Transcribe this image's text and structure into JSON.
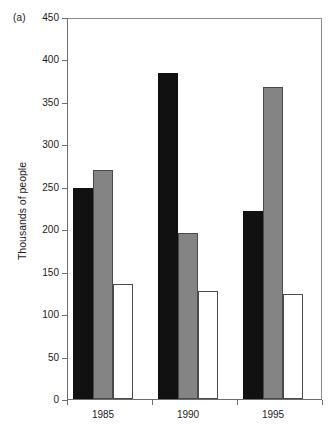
{
  "figure": {
    "panel_label": "(a)",
    "ylabel": "Thousands of people"
  },
  "chart_data": {
    "type": "bar",
    "title": "",
    "subtitle": "",
    "panel": "(a)",
    "xlabel": "",
    "ylabel": "Thousands of people",
    "categories": [
      "1985",
      "1990",
      "1995"
    ],
    "series": [
      {
        "name": "series-1",
        "color": "#111111",
        "fill": "black",
        "values": [
          248,
          384,
          222
        ]
      },
      {
        "name": "series-2",
        "color": "#848484",
        "fill": "gray",
        "values": [
          270,
          195,
          368
        ]
      },
      {
        "name": "series-3",
        "color": "#ffffff",
        "fill": "white",
        "values": [
          135,
          127,
          124
        ]
      }
    ],
    "ylim": [
      0,
      450
    ],
    "ytick_step": 50,
    "yticks": [
      0,
      50,
      100,
      150,
      200,
      250,
      300,
      350,
      400,
      450
    ],
    "ytick_labels": [
      "0",
      "50",
      "100",
      "150",
      "200",
      "250",
      "300",
      "350",
      "400",
      "450"
    ],
    "grid": false,
    "legend": null,
    "legend_position": "none",
    "annotations": []
  },
  "axis": {
    "y_tick_labels": [
      "450",
      "400",
      "350",
      "300",
      "250",
      "200",
      "150",
      "100",
      "50",
      "0"
    ],
    "x_tick_labels": [
      "1985",
      "1990",
      "1995"
    ]
  }
}
